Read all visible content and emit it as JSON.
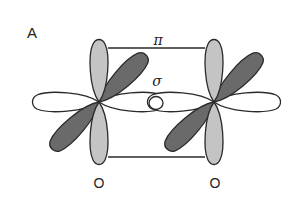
{
  "figure": {
    "panel_label": "A",
    "bond_labels": {
      "pi": "π",
      "sigma": "σ"
    },
    "atoms": [
      {
        "label": "O",
        "center": [
          99,
          102
        ]
      },
      {
        "label": "O",
        "center": [
          214,
          102
        ]
      }
    ],
    "colors": {
      "light_lobe": "#c4c4c4",
      "dark_lobe": "#6a6a6a",
      "outline": "#2a2a2a",
      "hollow_lobe": "#ffffff",
      "bond_line": "#2a2a2a"
    }
  }
}
